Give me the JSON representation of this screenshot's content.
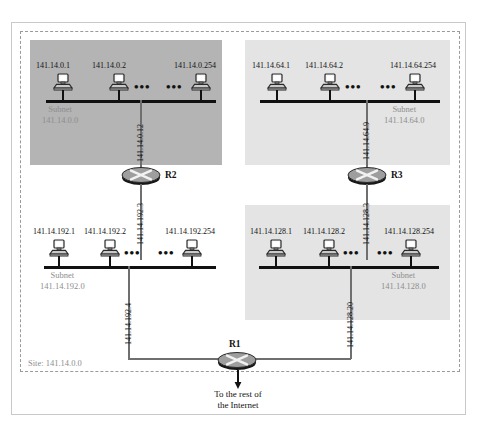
{
  "diagram": {
    "site_label": "Site: 141.14.0.0",
    "internet_caption_line1": "To the rest of",
    "internet_caption_line2": "the Internet",
    "ellipsis": "•••"
  },
  "subnets": [
    {
      "id": "subnet-141-14-0-0",
      "caption_line1": "Subnet",
      "caption_line2": "141.14.0.0",
      "hosts": [
        {
          "ip": "141.14.0.1"
        },
        {
          "ip": "141.14.0.2"
        },
        {
          "ip": "141.14.0.254"
        }
      ],
      "uplink_label": "141.14.0.12"
    },
    {
      "id": "subnet-141-14-64-0",
      "caption_line1": "Subnet",
      "caption_line2": "141.14.64.0",
      "hosts": [
        {
          "ip": "141.14.64.1"
        },
        {
          "ip": "141.14.64.2"
        },
        {
          "ip": "141.14.64.254"
        }
      ],
      "uplink_label": "141.14.64.9"
    },
    {
      "id": "subnet-141-14-192-0",
      "caption_line1": "Subnet",
      "caption_line2": "141.14.192.0",
      "hosts": [
        {
          "ip": "141.14.192.1"
        },
        {
          "ip": "141.14.192.2"
        },
        {
          "ip": "141.14.192.254"
        }
      ],
      "uplink_label": "141.14.192.3",
      "downlink_label": "141.14.192.4"
    },
    {
      "id": "subnet-141-14-128-0",
      "caption_line1": "Subnet",
      "caption_line2": "141.14.128.0",
      "hosts": [
        {
          "ip": "141.14.128.1"
        },
        {
          "ip": "141.14.128.2"
        },
        {
          "ip": "141.14.128.254"
        }
      ],
      "uplink_label": "141.14.128.3",
      "downlink_label": "141.14.128.20"
    }
  ],
  "routers": [
    {
      "id": "router-r2",
      "label": "R2"
    },
    {
      "id": "router-r3",
      "label": "R3"
    },
    {
      "id": "router-r1",
      "label": "R1"
    }
  ],
  "colors": {
    "region_dark": "#b4b4b4",
    "region_light": "#e4e4e4",
    "bus": "#111111",
    "link": "#6f6f6f",
    "caption": "#8d8d8d",
    "boundary": "#9a9a9a"
  }
}
